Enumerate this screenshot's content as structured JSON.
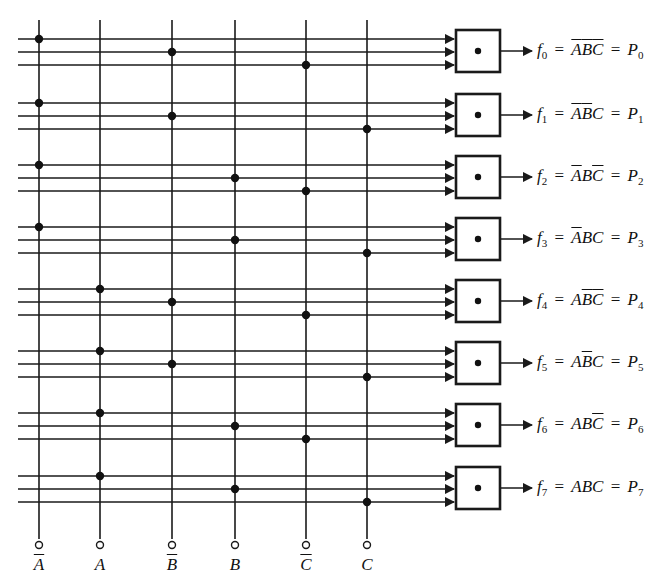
{
  "diagram": {
    "type": "logic-diagram",
    "colors": {
      "line": "#1a1a1a",
      "background": "#ffffff",
      "dot": "#111111"
    },
    "inputs": [
      {
        "id": "nA",
        "label": "A",
        "overbar": true,
        "x": 39
      },
      {
        "id": "A",
        "label": "A",
        "overbar": false,
        "x": 100
      },
      {
        "id": "nB",
        "label": "B",
        "overbar": true,
        "x": 172
      },
      {
        "id": "B",
        "label": "B",
        "overbar": false,
        "x": 235
      },
      {
        "id": "nC",
        "label": "C",
        "overbar": true,
        "x": 306
      },
      {
        "id": "C",
        "label": "C",
        "overbar": false,
        "x": 367
      }
    ],
    "gate_symbol": "and-dot",
    "rows": [
      {
        "f": "f",
        "f_sub": "0",
        "term": [
          {
            "v": "A",
            "bar": true
          },
          {
            "v": "B",
            "bar": true
          },
          {
            "v": "C",
            "bar": true
          }
        ],
        "p": "P",
        "p_sub": "0",
        "connections": [
          "nA",
          "nB",
          "nC"
        ],
        "y": [
          39,
          52,
          65
        ],
        "box_y": 30
      },
      {
        "f": "f",
        "f_sub": "1",
        "term": [
          {
            "v": "A",
            "bar": true
          },
          {
            "v": "B",
            "bar": true
          },
          {
            "v": "C",
            "bar": false
          }
        ],
        "p": "P",
        "p_sub": "1",
        "connections": [
          "nA",
          "nB",
          "C"
        ],
        "y": [
          103,
          116,
          129
        ],
        "box_y": 94
      },
      {
        "f": "f",
        "f_sub": "2",
        "term": [
          {
            "v": "A",
            "bar": true
          },
          {
            "v": "B",
            "bar": false
          },
          {
            "v": "C",
            "bar": true
          }
        ],
        "p": "P",
        "p_sub": "2",
        "connections": [
          "nA",
          "B",
          "nC"
        ],
        "y": [
          165,
          178,
          191
        ],
        "box_y": 156
      },
      {
        "f": "f",
        "f_sub": "3",
        "term": [
          {
            "v": "A",
            "bar": true
          },
          {
            "v": "B",
            "bar": false
          },
          {
            "v": "C",
            "bar": false
          }
        ],
        "p": "P",
        "p_sub": "3",
        "connections": [
          "nA",
          "B",
          "C"
        ],
        "y": [
          227,
          240,
          253
        ],
        "box_y": 218
      },
      {
        "f": "f",
        "f_sub": "4",
        "term": [
          {
            "v": "A",
            "bar": false
          },
          {
            "v": "B",
            "bar": true
          },
          {
            "v": "C",
            "bar": true
          }
        ],
        "p": "P",
        "p_sub": "4",
        "connections": [
          "A",
          "nB",
          "nC"
        ],
        "y": [
          289,
          302,
          315
        ],
        "box_y": 280
      },
      {
        "f": "f",
        "f_sub": "5",
        "term": [
          {
            "v": "A",
            "bar": false
          },
          {
            "v": "B",
            "bar": true
          },
          {
            "v": "C",
            "bar": false
          }
        ],
        "p": "P",
        "p_sub": "5",
        "connections": [
          "A",
          "nB",
          "C"
        ],
        "y": [
          351,
          364,
          377
        ],
        "box_y": 342
      },
      {
        "f": "f",
        "f_sub": "6",
        "term": [
          {
            "v": "A",
            "bar": false
          },
          {
            "v": "B",
            "bar": false
          },
          {
            "v": "C",
            "bar": true
          }
        ],
        "p": "P",
        "p_sub": "6",
        "connections": [
          "A",
          "B",
          "nC"
        ],
        "y": [
          413,
          426,
          439
        ],
        "box_y": 404
      },
      {
        "f": "f",
        "f_sub": "7",
        "term": [
          {
            "v": "A",
            "bar": false
          },
          {
            "v": "B",
            "bar": false
          },
          {
            "v": "C",
            "bar": false
          }
        ],
        "p": "P",
        "p_sub": "7",
        "connections": [
          "A",
          "B",
          "C"
        ],
        "y": [
          476,
          489,
          502
        ],
        "box_y": 467
      }
    ],
    "geometry": {
      "wire_x_start": 18,
      "wire_x_end": 452,
      "box_left": 456,
      "box_width": 44,
      "box_height": 42,
      "out_wire_end": 532,
      "label_x": 537,
      "vline_top": 20,
      "vline_bottom": 539,
      "terminal_y": 545,
      "terminal_r": 3.5,
      "input_label_y": 556
    }
  }
}
